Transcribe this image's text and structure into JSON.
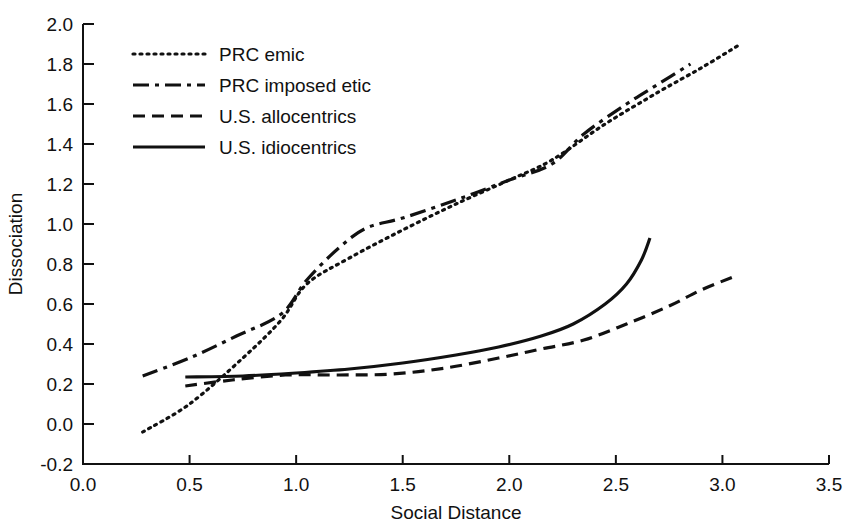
{
  "chart_data": {
    "type": "line",
    "title": "",
    "xlabel": "Social Distance",
    "ylabel": "Dissociation",
    "xlim": [
      0.0,
      3.5
    ],
    "ylim": [
      -0.2,
      2.0
    ],
    "xticks": [
      "0.0",
      "0.5",
      "1.0",
      "1.5",
      "2.0",
      "2.5",
      "3.0",
      "3.5"
    ],
    "xtick_values": [
      0.0,
      0.5,
      1.0,
      1.5,
      2.0,
      2.5,
      3.0,
      3.5
    ],
    "yticks": [
      "-0.2",
      "0.0",
      "0.2",
      "0.4",
      "0.6",
      "0.8",
      "1.0",
      "1.2",
      "1.4",
      "1.6",
      "1.8",
      "2.0"
    ],
    "ytick_values": [
      -0.2,
      0.0,
      0.2,
      0.4,
      0.6,
      0.8,
      1.0,
      1.2,
      1.4,
      1.6,
      1.8,
      2.0
    ],
    "grid": false,
    "legend_position": "upper-left-inside",
    "series": [
      {
        "name": "PRC emic",
        "style": "dotted",
        "dash": "2,5",
        "width": 3.2,
        "points": [
          [
            0.28,
            -0.04
          ],
          [
            0.5,
            0.1
          ],
          [
            0.75,
            0.33
          ],
          [
            0.93,
            0.52
          ],
          [
            1.05,
            0.7
          ],
          [
            1.25,
            0.83
          ],
          [
            1.5,
            0.97
          ],
          [
            1.75,
            1.1
          ],
          [
            2.0,
            1.22
          ],
          [
            2.2,
            1.32
          ],
          [
            2.45,
            1.5
          ],
          [
            2.7,
            1.66
          ],
          [
            2.9,
            1.78
          ],
          [
            3.07,
            1.89
          ]
        ]
      },
      {
        "name": "PRC imposed etic",
        "style": "dash-dot",
        "dash": "16,6,4,6",
        "width": 3.2,
        "points": [
          [
            0.28,
            0.24
          ],
          [
            0.5,
            0.33
          ],
          [
            0.72,
            0.44
          ],
          [
            0.93,
            0.55
          ],
          [
            1.05,
            0.72
          ],
          [
            1.2,
            0.88
          ],
          [
            1.33,
            0.98
          ],
          [
            1.5,
            1.03
          ],
          [
            1.75,
            1.12
          ],
          [
            2.0,
            1.22
          ],
          [
            2.2,
            1.3
          ],
          [
            2.35,
            1.45
          ],
          [
            2.55,
            1.6
          ],
          [
            2.7,
            1.7
          ],
          [
            2.85,
            1.8
          ]
        ]
      },
      {
        "name": "U.S. allocentrics",
        "style": "dashed",
        "dash": "12,7",
        "width": 3.2,
        "points": [
          [
            0.48,
            0.19
          ],
          [
            0.7,
            0.22
          ],
          [
            0.95,
            0.245
          ],
          [
            1.2,
            0.245
          ],
          [
            1.45,
            0.25
          ],
          [
            1.7,
            0.28
          ],
          [
            1.95,
            0.33
          ],
          [
            2.15,
            0.375
          ],
          [
            2.35,
            0.42
          ],
          [
            2.55,
            0.5
          ],
          [
            2.75,
            0.59
          ],
          [
            2.9,
            0.67
          ],
          [
            3.05,
            0.735
          ]
        ]
      },
      {
        "name": "U.S. idiocentrics",
        "style": "solid",
        "dash": "none",
        "width": 3.2,
        "points": [
          [
            0.48,
            0.235
          ],
          [
            0.75,
            0.24
          ],
          [
            1.0,
            0.255
          ],
          [
            1.25,
            0.275
          ],
          [
            1.5,
            0.305
          ],
          [
            1.75,
            0.345
          ],
          [
            1.95,
            0.385
          ],
          [
            2.15,
            0.44
          ],
          [
            2.3,
            0.5
          ],
          [
            2.45,
            0.6
          ],
          [
            2.55,
            0.7
          ],
          [
            2.62,
            0.82
          ],
          [
            2.66,
            0.93
          ]
        ]
      }
    ]
  },
  "legend": {
    "items": [
      {
        "label": "PRC emic"
      },
      {
        "label": "PRC imposed etic"
      },
      {
        "label": "U.S. allocentrics"
      },
      {
        "label": "U.S. idiocentrics"
      }
    ]
  },
  "axes": {
    "x_title": "Social Distance",
    "y_title": "Dissociation"
  }
}
